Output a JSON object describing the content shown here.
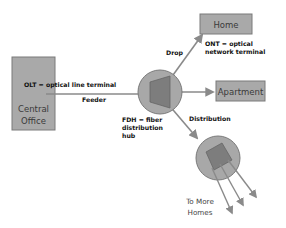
{
  "colors": {
    "box_fill": "#a9a9a9",
    "box_stroke": "#7a7a7a",
    "circle_fill": "#a8a8a8",
    "splitter_fill": "#7d7d7d",
    "line": "#8a8a8a",
    "text_dark": "#111111"
  },
  "nodes": {
    "central_office": {
      "label_line1": "Central",
      "label_line2": "Office"
    },
    "home": {
      "label": "Home"
    },
    "apartment": {
      "label": "Apartment"
    },
    "to_more_homes": {
      "label_line1": "To More",
      "label_line2": "Homes"
    }
  },
  "annotations": {
    "olt": "OLT = optical line terminal",
    "ont_line1": "ONT = optical",
    "ont_line2": "network terminal",
    "fdh_line1": "FDH = fiber",
    "fdh_line2": "distribution",
    "fdh_line3": "hub"
  },
  "links": {
    "feeder": "Feeder",
    "drop": "Drop",
    "distribution": "Distribution"
  }
}
